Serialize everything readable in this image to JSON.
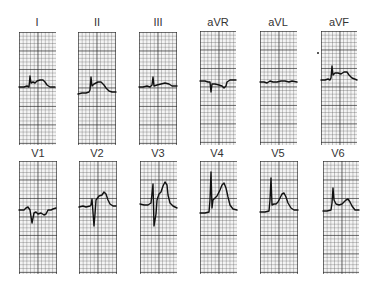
{
  "figure": {
    "rows": [
      {
        "leads": [
          {
            "label": "I",
            "label_x": 37,
            "label_y": 17,
            "grid": {
              "x": 19,
              "y": 32,
              "w": 37,
              "h": 113
            }
          },
          {
            "label": "II",
            "label_x": 97,
            "label_y": 17,
            "grid": {
              "x": 78,
              "y": 32,
              "w": 38,
              "h": 113
            }
          },
          {
            "label": "III",
            "label_x": 158,
            "label_y": 17,
            "grid": {
              "x": 139,
              "y": 32,
              "w": 38,
              "h": 113
            }
          },
          {
            "label": "aVR",
            "label_x": 218,
            "label_y": 15,
            "grid": {
              "x": 200,
              "y": 31,
              "w": 36,
              "h": 114
            }
          },
          {
            "label": "aVL",
            "label_x": 278,
            "label_y": 15,
            "grid": {
              "x": 260,
              "y": 31,
              "w": 37,
              "h": 114
            }
          },
          {
            "label": "aVF",
            "label_x": 339,
            "label_y": 15,
            "grid": {
              "x": 321,
              "y": 31,
              "w": 36,
              "h": 114
            }
          }
        ]
      },
      {
        "leads": [
          {
            "label": "V1",
            "label_x": 38,
            "label_y": 147,
            "grid": {
              "x": 19,
              "y": 161,
              "w": 38,
              "h": 113
            }
          },
          {
            "label": "V2",
            "label_x": 97,
            "label_y": 147,
            "grid": {
              "x": 79,
              "y": 161,
              "w": 38,
              "h": 113
            }
          },
          {
            "label": "V3",
            "label_x": 158,
            "label_y": 147,
            "grid": {
              "x": 140,
              "y": 161,
              "w": 37,
              "h": 113
            }
          },
          {
            "label": "V4",
            "label_x": 217,
            "label_y": 147,
            "grid": {
              "x": 200,
              "y": 161,
              "w": 37,
              "h": 113
            }
          },
          {
            "label": "V5",
            "label_x": 278,
            "label_y": 147,
            "grid": {
              "x": 260,
              "y": 161,
              "w": 38,
              "h": 113
            }
          },
          {
            "label": "V6",
            "label_x": 338,
            "label_y": 147,
            "grid": {
              "x": 323,
              "y": 161,
              "w": 36,
              "h": 113
            }
          }
        ]
      }
    ],
    "traces": {
      "I": "M19,87 L24,87 L27,86 L29,87 L30,76 L31,83 L33,82 L35,83 L37,81 L40,80 L43,80 L45,82 L47,85 L50,87 L55,87",
      "II": "M78,94 L82,93 L86,93 L89,92 L90,90 L91,77 L92,86 L94,84 L96,83 L98,82 L101,82 L104,85 L106,88 L109,91 L112,92 L116,92",
      "III": "M139,87 L143,87 L147,86 L150,87 L152,85 L153,77 L154,86 L157,85 L161,84 L165,83 L169,84 L172,86 L177,86",
      "aVR": "M200,81 L205,81 L208,82 L210,82 L211,92 L212,84 L215,84 L219,85 L222,86 L224,88 L226,86 L227,82 L230,80 L236,80",
      "aVL": "M260,82 L264,82 L267,83 L270,81 L273,82 L277,82 L281,81 L285,81 L289,82 L292,81 L297,82",
      "aVF": "M321,80 L325,80 L328,79 L330,80 L331,78 L332,66 L333,75 L335,73 L338,73 L341,74 L344,72 L347,72 L349,75 L352,78 L357,80",
      "V1": "M19,210 L24,210 L26,208 L28,207 L30,210 L32,223 L34,213 L36,212 L38,214 L41,213 L44,215 L46,214 L48,210 L51,210 L53,209 L56,208",
      "V2": "M79,207 L83,206 L86,207 L90,206 L91,205 L92,199 L94,226 L95,214 L96,200 L99,196 L102,195 L104,192 L106,194 L108,200 L110,204 L113,206 L116,206",
      "V3": "M140,204 L144,205 L148,205 L151,203 L153,184 L154,226 L156,214 L157,200 L159,194 L161,192 L163,186 L165,182 L167,185 L168,195 L170,203 L173,206 L177,208",
      "V4": "M200,213 L205,213 L209,212 L210,200 L211,172 L212,208 L213,200 L215,198 L217,196 L220,190 L222,185 L224,183 L226,188 L228,197 L230,205 L233,209 L237,210",
      "V5": "M260,212 L265,212 L269,211 L270,200 L271,178 L272,205 L274,204 L276,204 L278,202 L280,198 L282,194 L284,193 L286,197 L288,203 L291,208 L294,210 L298,210",
      "V6": "M323,211 L327,211 L331,210 L332,203 L333,188 L334,200 L336,204 L339,205 L342,204 L344,202 L346,200 L348,199 L350,202 L352,206 L355,210 L359,210"
    },
    "marker_dot": {
      "x": 317,
      "y": 52
    }
  }
}
